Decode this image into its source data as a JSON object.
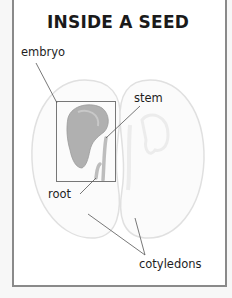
{
  "title": "INSIDE A SEED",
  "labels": {
    "embryo": "embryo",
    "stem": "stem",
    "root": "root",
    "cotyledons": "cotyledons"
  },
  "colors": {
    "frame_border": "#8a8a8a",
    "seed_outline": "#e2e2e2",
    "embryo_fill": "#a6a6a6",
    "leader_line": "#555555",
    "text": "#1e1e1e"
  }
}
